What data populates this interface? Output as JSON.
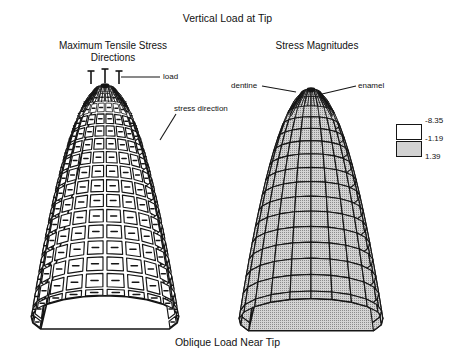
{
  "figure": {
    "main_title": "Vertical Load at Tip",
    "bottom_caption": "Oblique Load Near Tip",
    "width": 455,
    "height": 362,
    "background_color": "#ffffff",
    "line_color": "#151515",
    "text_color": "#121212"
  },
  "panels": [
    {
      "id": "maximum-tensile-stress-directions",
      "title": "Maximum Tensile Stress\nDirections",
      "title_line1": "Maximum Tensile Stress",
      "title_line2": "Directions",
      "cell_render": "direction-tick",
      "fill": "#ffffff",
      "center_x": 105,
      "apex_y": 84,
      "base_y": 318,
      "half_width": 74,
      "rings": 16,
      "meridians": 14,
      "annotations": [
        {
          "name": "load",
          "label": "load",
          "label_x": 163,
          "label_y": 72,
          "leader_from_x": 160,
          "leader_from_y": 77,
          "leader_to_x": 121,
          "leader_to_y": 77
        },
        {
          "name": "stress-direction",
          "label": "stress direction",
          "label_x": 174,
          "label_y": 104,
          "leader_from_x": 176,
          "leader_from_y": 114,
          "leader_to_x": 160,
          "leader_to_y": 140
        }
      ],
      "load_arrows": [
        {
          "x": 91,
          "y_top": 71,
          "y_bottom": 84
        },
        {
          "x": 105,
          "y_top": 69,
          "y_bottom": 83
        },
        {
          "x": 119,
          "y_top": 71,
          "y_bottom": 84
        }
      ]
    },
    {
      "id": "stress-magnitudes",
      "title": "Stress Magnitudes",
      "title_line1": "Stress Magnitudes",
      "title_line2": "",
      "cell_render": "stipple-fill",
      "fill": "#d2d2d2",
      "center_x": 311,
      "apex_y": 88,
      "base_y": 320,
      "half_width": 72,
      "rings": 16,
      "meridians": 14,
      "annotations": [
        {
          "name": "dentine",
          "label": "dentine",
          "label_x": 231,
          "label_y": 81,
          "leader_from_x": 262,
          "leader_from_y": 86,
          "leader_to_x": 296,
          "leader_to_y": 92
        },
        {
          "name": "enamel",
          "label": "enamel",
          "label_x": 358,
          "label_y": 81,
          "leader_from_x": 356,
          "leader_from_y": 86,
          "leader_to_x": 322,
          "leader_to_y": 94
        }
      ],
      "load_arrows": []
    }
  ],
  "legend": {
    "name": "stress-magnitude-legend",
    "values": [
      "-8.35",
      "-1.19",
      "1.39"
    ],
    "swatches": [
      {
        "name": "legend-swatch-white",
        "fill": "#ffffff",
        "pattern": "none"
      },
      {
        "name": "legend-swatch-stipple",
        "fill": "#d2d2d2",
        "pattern": "stipple"
      }
    ]
  },
  "chart_data": {
    "type": "diagram",
    "title": "Vertical Load at Tip",
    "subtitle": "Oblique Load Near Tip",
    "panels": [
      "Maximum Tensile Stress Directions",
      "Stress Magnitudes"
    ],
    "annotations": [
      "load",
      "stress direction",
      "dentine",
      "enamel"
    ],
    "legend_title": "",
    "legend_entries": [
      {
        "label": "-8.35",
        "fill": "#ffffff"
      },
      {
        "label": "-1.19",
        "fill": "#ffffff"
      },
      {
        "label": "1.39",
        "fill": "#d2d2d2"
      }
    ],
    "legend_values": [
      -8.35,
      -1.19,
      1.39
    ],
    "mesh": {
      "rings": 16,
      "meridians": 14
    }
  }
}
